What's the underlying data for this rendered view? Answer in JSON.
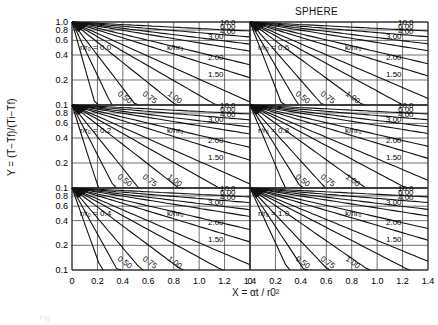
{
  "chart_data": {
    "type": "line",
    "title": "SPHERE",
    "xlabel": "X = αt / r0²",
    "ylabel": "Y = (T − Tf) / (Ti − Tf)",
    "x_ticks": [
      "0",
      "0.2",
      "0.4",
      "0.6",
      "0.8",
      "1.0",
      "1.2",
      "1.4"
    ],
    "y_ticks": [
      "0.1",
      "0.2",
      "0.4",
      "0.6",
      "0.8",
      "1.0"
    ],
    "xlim": [
      0,
      1.4
    ],
    "ylim": [
      0.1,
      1.0
    ],
    "yscale": "log",
    "grid": true,
    "panel_layout": {
      "rows": 3,
      "cols": 2
    },
    "parameter_label": "k / h r0",
    "panels": [
      {
        "r_over_r0": "0.0",
        "curves": [
          "0",
          "0.10",
          "0.25",
          "0.50",
          "0.75",
          "1.00",
          "1.50",
          "2.00",
          "3.00",
          "4.00",
          "6.00",
          "10.0"
        ]
      },
      {
        "r_over_r0": "0.6",
        "curves": [
          "0",
          "0.10",
          "0.25",
          "0.50",
          "0.75",
          "1.00",
          "1.50",
          "2.00",
          "3.00",
          "4.00",
          "6.00",
          "10.0"
        ]
      },
      {
        "r_over_r0": "0.2",
        "curves": [
          "0",
          "0.10",
          "0.25",
          "0.50",
          "0.75",
          "1.00",
          "1.50",
          "2.00",
          "3.00",
          "4.00",
          "6.00",
          "10.0"
        ]
      },
      {
        "r_over_r0": "0.8",
        "curves": [
          "0",
          "0.10",
          "0.25",
          "0.50",
          "0.75",
          "1.00",
          "1.50",
          "2.00",
          "3.00",
          "4.00",
          "6.00",
          "10.0"
        ]
      },
      {
        "r_over_r0": "0.4",
        "curves": [
          "0",
          "0.10",
          "0.25",
          "0.50",
          "0.75",
          "1.00",
          "1.50",
          "2.00",
          "3.00",
          "4.00",
          "6.00",
          "10.0"
        ]
      },
      {
        "r_over_r0": "1.0",
        "curves": [
          "0",
          "0.10",
          "0.25",
          "0.50",
          "0.75",
          "1.00",
          "1.50",
          "2.00",
          "3.00",
          "4.00",
          "6.00",
          "10.0"
        ]
      }
    ],
    "curve_label_values": [
      "0",
      "0.10",
      "0.25",
      "0.50",
      "0.75",
      "1.00",
      "1.50",
      "2.00",
      "3.00",
      "4.00",
      "6.00",
      "10.0"
    ],
    "annotation_prefix": "r / r0 ="
  },
  "labels": {
    "title": "SPHERE",
    "ylabel": "Y = (T−Tf)/(Ti−Tf)",
    "xlabel": "X = αt / r0²",
    "caption": "Fig."
  }
}
